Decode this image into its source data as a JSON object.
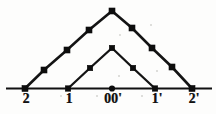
{
  "figure": {
    "background_color": "#fdfdfc",
    "ink_color": "#111111",
    "width": 216,
    "height": 114
  },
  "axis": {
    "name": "horizontal-baseline",
    "y": 88.5,
    "x_start": 6,
    "x_end": 212,
    "stroke": "#111111",
    "stroke_width": 2.1,
    "origin_marker": {
      "shape": "circle",
      "x": 112,
      "y": 88.5,
      "radius": 3.1
    },
    "ticks": [
      {
        "label": "2",
        "x": 25,
        "label_x": 26,
        "label_y": 92
      },
      {
        "label": "1",
        "x": 68,
        "label_x": 69,
        "label_y": 92
      },
      {
        "label": "00'",
        "x": 112,
        "label_x": 113,
        "label_y": 92
      },
      {
        "label": "1'",
        "x": 155,
        "label_x": 157,
        "label_y": 92
      },
      {
        "label": "2'",
        "x": 192,
        "label_x": 194,
        "label_y": 92
      }
    ]
  },
  "chart_data": {
    "type": "line",
    "title": "",
    "xlabel": "",
    "ylabel": "",
    "grid": false,
    "legend": "none",
    "xlim": [
      6,
      212
    ],
    "ylim": [
      88.5,
      10
    ],
    "xticks": [
      "2",
      "1",
      "00'",
      "1'",
      "2'"
    ],
    "series": [
      {
        "name": "outer-triangle",
        "stroke": "#141414",
        "stroke_width": 2.6,
        "marker": "square",
        "marker_size": 6,
        "points": [
          {
            "x": 25,
            "y": 88.5,
            "marker": true
          },
          {
            "x": 44,
            "y": 70,
            "marker": true
          },
          {
            "x": 67,
            "y": 50,
            "marker": true
          },
          {
            "x": 89,
            "y": 30,
            "marker": true
          },
          {
            "x": 112,
            "y": 11,
            "marker": true
          },
          {
            "x": 132,
            "y": 28,
            "marker": true
          },
          {
            "x": 152,
            "y": 48,
            "marker": true
          },
          {
            "x": 172,
            "y": 67,
            "marker": true
          },
          {
            "x": 192,
            "y": 88.5,
            "marker": true
          }
        ]
      },
      {
        "name": "inner-triangle",
        "stroke": "#141414",
        "stroke_width": 2.3,
        "marker": "square",
        "marker_size": 5.4,
        "points": [
          {
            "x": 68,
            "y": 88.5,
            "marker": true
          },
          {
            "x": 90,
            "y": 68,
            "marker": true
          },
          {
            "x": 112,
            "y": 48,
            "marker": true
          },
          {
            "x": 133,
            "y": 68,
            "marker": true
          },
          {
            "x": 155,
            "y": 88.5,
            "marker": true
          }
        ]
      }
    ]
  },
  "specks": [
    {
      "x": 60,
      "y": 95,
      "d": 2
    },
    {
      "x": 96,
      "y": 95,
      "d": 1.6
    },
    {
      "x": 141,
      "y": 95,
      "d": 1.6
    },
    {
      "x": 119,
      "y": 34,
      "d": 1.8
    },
    {
      "x": 150,
      "y": 24,
      "d": 1.5
    },
    {
      "x": 118,
      "y": 75,
      "d": 1.5
    },
    {
      "x": 156,
      "y": 70,
      "d": 1.5
    }
  ]
}
